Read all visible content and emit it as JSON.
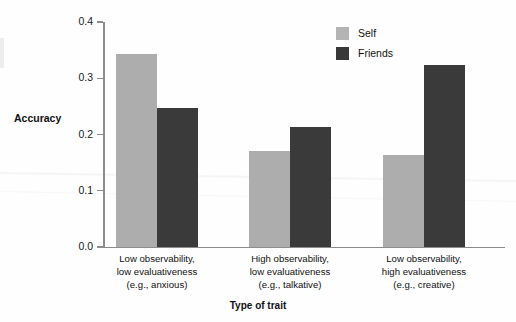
{
  "chart_data": {
    "type": "bar",
    "title": "",
    "xlabel": "Type of trait",
    "ylabel": "Accuracy",
    "ylim": [
      0.0,
      0.4
    ],
    "ytick_labels": [
      "0.0",
      "0.1",
      "0.2",
      "0.3",
      "0.4"
    ],
    "ytick_values": [
      0.0,
      0.1,
      0.2,
      0.3,
      0.4
    ],
    "grid": false,
    "legend_position": "top-right",
    "categories": [
      "Low observability, low evaluativeness (e.g., anxious)",
      "High observability, low evaluativeness (e.g., talkative)",
      "Low observability, high evaluativeness (e.g., creative)"
    ],
    "category_lines": [
      [
        "Low observability,",
        "low evaluativeness",
        "(e.g., anxious)"
      ],
      [
        "High observability,",
        "low evaluativeness",
        "(e.g., talkative)"
      ],
      [
        "Low observability,",
        "high evaluativeness",
        "(e.g., creative)"
      ]
    ],
    "series": [
      {
        "name": "Self",
        "color": "#adadad",
        "values": [
          0.343,
          0.171,
          0.163
        ]
      },
      {
        "name": "Friends",
        "color": "#3a3a3a",
        "values": [
          0.247,
          0.213,
          0.324
        ]
      }
    ]
  },
  "axes": {
    "y_title": "Accuracy",
    "x_title": "Type of trait"
  },
  "legend": {
    "items": [
      {
        "label": "Self",
        "color": "#adadad"
      },
      {
        "label": "Friends",
        "color": "#3a3a3a"
      }
    ]
  }
}
